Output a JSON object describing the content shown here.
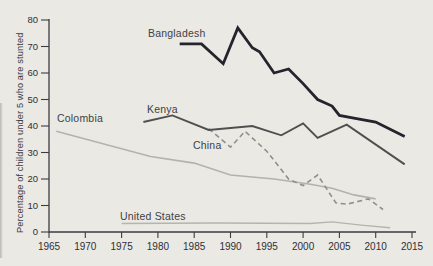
{
  "figure": {
    "background": "#eae9e4",
    "axis_color": "#3c3c40",
    "tick_text_color": "#2f2f34",
    "label_text_color": "#414146"
  },
  "chart_data": {
    "type": "line",
    "title": "",
    "xlabel": "",
    "ylabel": "Percentage of children under 5 who are stunted",
    "xlim": [
      1965,
      2015
    ],
    "ylim": [
      0,
      80
    ],
    "x_ticks": [
      1965,
      1970,
      1975,
      1980,
      1985,
      1990,
      1995,
      2000,
      2005,
      2010,
      2015
    ],
    "y_ticks": [
      0,
      10,
      20,
      30,
      40,
      50,
      60,
      70,
      80
    ],
    "grid": false,
    "legend_position": "inline-labels-near-lines",
    "series": [
      {
        "name": "Bangladesh",
        "color": "#24242c",
        "width": 2.8,
        "dash": null,
        "points": [
          [
            1983,
            71
          ],
          [
            1986,
            71
          ],
          [
            1989,
            63.5
          ],
          [
            1991,
            77
          ],
          [
            1993,
            69.5
          ],
          [
            1994,
            68
          ],
          [
            1996,
            60
          ],
          [
            1998,
            61.5
          ],
          [
            2000,
            56
          ],
          [
            2002,
            50
          ],
          [
            2004,
            47.5
          ],
          [
            2005,
            44
          ],
          [
            2007,
            43
          ],
          [
            2010,
            41.5
          ],
          [
            2014,
            36
          ]
        ]
      },
      {
        "name": "Kenya",
        "color": "#504f4f",
        "width": 1.9,
        "dash": null,
        "points": [
          [
            1978,
            41.5
          ],
          [
            1982,
            44
          ],
          [
            1987,
            38.5
          ],
          [
            1993,
            40
          ],
          [
            1997,
            36.5
          ],
          [
            2000,
            41
          ],
          [
            2002,
            35.5
          ],
          [
            2006,
            40.5
          ],
          [
            2014,
            25.5
          ]
        ]
      },
      {
        "name": "China",
        "color": "#8f8f8d",
        "width": 1.6,
        "dash": "5 3.5",
        "points": [
          [
            1987,
            39
          ],
          [
            1990,
            32
          ],
          [
            1992,
            38
          ],
          [
            1995,
            30.5
          ],
          [
            1998,
            20
          ],
          [
            2000,
            17.5
          ],
          [
            2002,
            21.5
          ],
          [
            2004.5,
            11
          ],
          [
            2006,
            10.5
          ],
          [
            2009,
            12.5
          ],
          [
            2011,
            8.5
          ]
        ]
      },
      {
        "name": "Colombia",
        "color": "#b3b2ae",
        "width": 1.6,
        "dash": null,
        "points": [
          [
            1966,
            38
          ],
          [
            1979,
            28.5
          ],
          [
            1985,
            26
          ],
          [
            1990,
            21.5
          ],
          [
            1996,
            20
          ],
          [
            2001,
            18
          ],
          [
            2004,
            16.5
          ],
          [
            2007,
            14
          ],
          [
            2010,
            12.5
          ]
        ]
      },
      {
        "name": "United States",
        "color": "#b5b4b0",
        "width": 1.4,
        "dash": null,
        "points": [
          [
            1975,
            3.2
          ],
          [
            1988,
            3.4
          ],
          [
            2001,
            3.2
          ],
          [
            2004,
            3.8
          ],
          [
            2008,
            2.6
          ],
          [
            2012,
            1.6
          ]
        ]
      }
    ]
  }
}
